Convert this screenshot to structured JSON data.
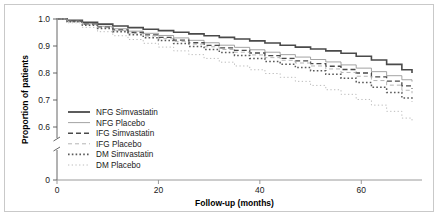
{
  "chart_data": {
    "type": "line",
    "title": "",
    "xlabel": "Follow-up (months)",
    "ylabel": "Proportion of patients",
    "xlim": [
      0,
      72
    ],
    "ylim": [
      0.55,
      1.0
    ],
    "xticks": [
      0,
      20,
      40,
      60
    ],
    "xtick_labels": [
      "0",
      "20",
      "40",
      "60"
    ],
    "yticks": [
      0.6,
      0.7,
      0.8,
      0.9,
      1.0
    ],
    "ytick_labels": [
      "0.6",
      "0.7",
      "0.8",
      "0.9",
      "1.0"
    ],
    "y_axis_break": true,
    "y_axis_break_label": "0",
    "grid": false,
    "legend_position": "lower-left-inside",
    "series": [
      {
        "name": "NFG Simvastatin",
        "style": "solid",
        "width": 1.6,
        "color": "#4a4a4a",
        "x": [
          0,
          2,
          5,
          8,
          11,
          14,
          17,
          20,
          23,
          26,
          29,
          32,
          35,
          38,
          41,
          44,
          47,
          50,
          53,
          56,
          59,
          62,
          65,
          68,
          70
        ],
        "y": [
          1.0,
          0.995,
          0.988,
          0.981,
          0.974,
          0.968,
          0.962,
          0.957,
          0.951,
          0.945,
          0.938,
          0.932,
          0.926,
          0.919,
          0.911,
          0.903,
          0.896,
          0.889,
          0.882,
          0.873,
          0.862,
          0.848,
          0.832,
          0.812,
          0.8
        ]
      },
      {
        "name": "NFG Placebo",
        "style": "solid",
        "width": 0.8,
        "color": "#8c8c8c",
        "x": [
          0,
          2,
          5,
          8,
          11,
          14,
          17,
          20,
          23,
          26,
          29,
          32,
          35,
          38,
          41,
          44,
          47,
          50,
          53,
          56,
          59,
          62,
          65,
          68,
          70
        ],
        "y": [
          1.0,
          0.993,
          0.983,
          0.973,
          0.964,
          0.955,
          0.947,
          0.939,
          0.93,
          0.921,
          0.912,
          0.903,
          0.895,
          0.886,
          0.877,
          0.868,
          0.859,
          0.85,
          0.841,
          0.83,
          0.818,
          0.805,
          0.79,
          0.775,
          0.768
        ]
      },
      {
        "name": "IFG Simvastatin",
        "style": "dashed",
        "width": 1.3,
        "color": "#4a4a4a",
        "x": [
          0,
          2,
          5,
          8,
          11,
          14,
          17,
          20,
          23,
          26,
          29,
          32,
          35,
          38,
          41,
          44,
          47,
          50,
          53,
          56,
          59,
          62,
          65,
          68,
          70
        ],
        "y": [
          1.0,
          0.992,
          0.981,
          0.97,
          0.96,
          0.95,
          0.941,
          0.932,
          0.922,
          0.912,
          0.902,
          0.893,
          0.884,
          0.874,
          0.864,
          0.854,
          0.845,
          0.835,
          0.825,
          0.813,
          0.8,
          0.786,
          0.77,
          0.752,
          0.742
        ]
      },
      {
        "name": "IFG Placebo",
        "style": "dashed",
        "width": 0.9,
        "color": "#adadad",
        "x": [
          0,
          2,
          5,
          8,
          11,
          14,
          17,
          20,
          23,
          26,
          29,
          32,
          35,
          38,
          41,
          44,
          47,
          50,
          53,
          56,
          59,
          62,
          65,
          68,
          70
        ],
        "y": [
          1.0,
          0.991,
          0.979,
          0.968,
          0.957,
          0.947,
          0.937,
          0.927,
          0.917,
          0.907,
          0.897,
          0.887,
          0.877,
          0.867,
          0.857,
          0.847,
          0.837,
          0.826,
          0.815,
          0.802,
          0.788,
          0.772,
          0.755,
          0.736,
          0.725
        ]
      },
      {
        "name": "DM Simvastatin",
        "style": "dotted",
        "width": 1.5,
        "color": "#5a5a5a",
        "x": [
          0,
          2,
          5,
          8,
          11,
          14,
          17,
          20,
          23,
          26,
          29,
          32,
          35,
          38,
          41,
          44,
          47,
          50,
          53,
          56,
          59,
          62,
          65,
          68,
          70
        ],
        "y": [
          1.0,
          0.99,
          0.977,
          0.965,
          0.953,
          0.942,
          0.931,
          0.92,
          0.909,
          0.898,
          0.887,
          0.876,
          0.865,
          0.854,
          0.843,
          0.832,
          0.82,
          0.808,
          0.795,
          0.781,
          0.765,
          0.747,
          0.728,
          0.707,
          0.695
        ]
      },
      {
        "name": "DM Placebo",
        "style": "dotted",
        "width": 1.0,
        "color": "#bcbcbc",
        "x": [
          0,
          2,
          5,
          8,
          11,
          14,
          17,
          20,
          23,
          26,
          29,
          32,
          35,
          38,
          41,
          44,
          47,
          50,
          53,
          56,
          59,
          62,
          65,
          68,
          70
        ],
        "y": [
          1.0,
          0.986,
          0.969,
          0.953,
          0.938,
          0.924,
          0.91,
          0.896,
          0.882,
          0.868,
          0.854,
          0.84,
          0.826,
          0.812,
          0.798,
          0.784,
          0.769,
          0.754,
          0.738,
          0.721,
          0.702,
          0.681,
          0.658,
          0.633,
          0.618
        ]
      }
    ],
    "legend": [
      {
        "label": "NFG Simvastatin",
        "style": "solid",
        "width": 1.8,
        "color": "#4a4a4a"
      },
      {
        "label": "NFG Placebo",
        "style": "solid",
        "width": 0.8,
        "color": "#8c8c8c"
      },
      {
        "label": "IFG Simvastatin",
        "style": "dashed",
        "width": 1.4,
        "color": "#4a4a4a"
      },
      {
        "label": "IFG Placebo",
        "style": "dashed",
        "width": 0.9,
        "color": "#adadad"
      },
      {
        "label": "DM Simvastatin",
        "style": "dotted",
        "width": 1.6,
        "color": "#5a5a5a"
      },
      {
        "label": "DM Placebo",
        "style": "dotted",
        "width": 1.0,
        "color": "#bcbcbc"
      }
    ]
  }
}
